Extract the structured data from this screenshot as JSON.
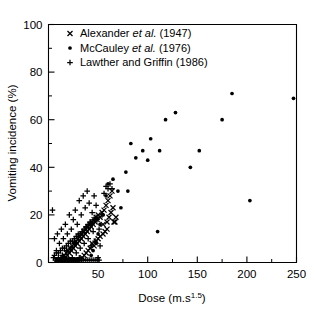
{
  "chart_data": {
    "type": "scatter",
    "title": "",
    "xlabel": "Dose (m.s1.5)",
    "xlabel_base": "Dose (m.s",
    "xlabel_sup": "1.5",
    "xlabel_tail": ")",
    "ylabel": "Vomiting incidence (%)",
    "xlim": [
      0,
      250
    ],
    "ylim": [
      0,
      100
    ],
    "xticks": [
      0,
      50,
      100,
      150,
      200,
      250
    ],
    "xticklabels": [
      "",
      "50",
      "100",
      "150",
      "200",
      "250"
    ],
    "xminorticks": [
      25,
      75,
      125,
      175,
      225
    ],
    "yticks": [
      0,
      20,
      40,
      60,
      80,
      100
    ],
    "yticklabels": [
      "0",
      "20",
      "40",
      "60",
      "80",
      "100"
    ],
    "yminorticks": [
      10,
      30,
      50,
      70,
      90
    ],
    "grid": false,
    "legend_position": "top-left",
    "series": [
      {
        "name": "Alexander et al. (1947)",
        "label_pre": "Alexander ",
        "label_italic": "et al.",
        "label_post": " (1947)",
        "marker": "x",
        "color": "#000000",
        "points": [
          [
            11,
            1
          ],
          [
            13,
            1
          ],
          [
            14,
            2
          ],
          [
            15,
            1
          ],
          [
            16,
            3
          ],
          [
            17,
            2
          ],
          [
            18,
            4
          ],
          [
            19,
            3
          ],
          [
            20,
            5
          ],
          [
            21,
            4
          ],
          [
            22,
            6
          ],
          [
            23,
            5
          ],
          [
            24,
            7
          ],
          [
            25,
            6
          ],
          [
            26,
            8
          ],
          [
            27,
            7
          ],
          [
            28,
            9
          ],
          [
            29,
            8
          ],
          [
            30,
            10
          ],
          [
            31,
            9
          ],
          [
            32,
            11
          ],
          [
            33,
            10
          ],
          [
            34,
            12
          ],
          [
            35,
            11
          ],
          [
            36,
            13
          ],
          [
            37,
            12
          ],
          [
            38,
            14
          ],
          [
            39,
            13
          ],
          [
            40,
            15
          ],
          [
            41,
            14
          ],
          [
            42,
            16
          ],
          [
            43,
            15
          ],
          [
            44,
            17
          ],
          [
            45,
            16
          ],
          [
            46,
            18
          ],
          [
            47,
            17
          ],
          [
            48,
            19
          ],
          [
            49,
            18
          ],
          [
            50,
            20
          ],
          [
            52,
            19
          ],
          [
            54,
            21
          ],
          [
            55,
            16
          ],
          [
            56,
            22
          ],
          [
            58,
            24
          ],
          [
            59,
            17
          ],
          [
            60,
            26
          ],
          [
            61,
            19
          ],
          [
            62,
            28
          ],
          [
            63,
            21
          ],
          [
            64,
            30
          ],
          [
            65,
            23
          ],
          [
            66,
            17
          ],
          [
            67,
            17
          ],
          [
            68,
            19
          ],
          [
            55,
            12
          ],
          [
            57,
            13
          ],
          [
            59,
            14
          ],
          [
            48,
            9
          ],
          [
            50,
            10
          ],
          [
            52,
            11
          ],
          [
            44,
            8
          ],
          [
            46,
            7
          ],
          [
            42,
            6
          ],
          [
            40,
            5
          ],
          [
            38,
            4
          ],
          [
            36,
            3
          ],
          [
            34,
            2
          ],
          [
            32,
            1
          ],
          [
            30,
            1
          ],
          [
            28,
            1
          ],
          [
            26,
            1
          ],
          [
            24,
            1
          ],
          [
            22,
            1
          ],
          [
            20,
            1
          ],
          [
            18,
            1
          ],
          [
            16,
            1
          ],
          [
            14,
            1
          ],
          [
            12,
            1
          ],
          [
            10,
            1
          ],
          [
            9,
            1
          ],
          [
            8,
            1
          ]
        ]
      },
      {
        "name": "McCauley et al. (1976)",
        "label_pre": "McCauley ",
        "label_italic": "et al.",
        "label_post": " (1976)",
        "marker": "circle",
        "color": "#000000",
        "points": [
          [
            65,
            35
          ],
          [
            70,
            30
          ],
          [
            73,
            23
          ],
          [
            78,
            38
          ],
          [
            80,
            30
          ],
          [
            83,
            50
          ],
          [
            88,
            44
          ],
          [
            95,
            47
          ],
          [
            100,
            43
          ],
          [
            103,
            52
          ],
          [
            110,
            13
          ],
          [
            112,
            47
          ],
          [
            118,
            60
          ],
          [
            128,
            63
          ],
          [
            143,
            40
          ],
          [
            152,
            47
          ],
          [
            175,
            60
          ],
          [
            185,
            71
          ],
          [
            203,
            26
          ],
          [
            247,
            69
          ],
          [
            60,
            33
          ],
          [
            58,
            28
          ],
          [
            55,
            20
          ],
          [
            52,
            16
          ],
          [
            50,
            12
          ],
          [
            48,
            8
          ],
          [
            45,
            5
          ],
          [
            43,
            3
          ]
        ]
      },
      {
        "name": "Lawther and Griffin (1986)",
        "label_pre": "Lawther and Griffin (1986)",
        "label_italic": "",
        "label_post": "",
        "marker": "plus",
        "color": "#000000",
        "points": [
          [
            4,
            22
          ],
          [
            6,
            10
          ],
          [
            8,
            5
          ],
          [
            9,
            12
          ],
          [
            10,
            2
          ],
          [
            11,
            8
          ],
          [
            12,
            1
          ],
          [
            13,
            14
          ],
          [
            14,
            3
          ],
          [
            15,
            10
          ],
          [
            16,
            2
          ],
          [
            17,
            16
          ],
          [
            18,
            5
          ],
          [
            19,
            12
          ],
          [
            20,
            1
          ],
          [
            21,
            20
          ],
          [
            22,
            6
          ],
          [
            23,
            14
          ],
          [
            24,
            2
          ],
          [
            25,
            18
          ],
          [
            26,
            8
          ],
          [
            27,
            22
          ],
          [
            28,
            4
          ],
          [
            29,
            16
          ],
          [
            30,
            11
          ],
          [
            31,
            26
          ],
          [
            32,
            6
          ],
          [
            33,
            20
          ],
          [
            34,
            13
          ],
          [
            35,
            28
          ],
          [
            36,
            8
          ],
          [
            37,
            23
          ],
          [
            38,
            15
          ],
          [
            39,
            30
          ],
          [
            40,
            10
          ],
          [
            41,
            25
          ],
          [
            42,
            17
          ],
          [
            43,
            7
          ],
          [
            44,
            21
          ],
          [
            45,
            13
          ],
          [
            46,
            28
          ],
          [
            47,
            9
          ],
          [
            48,
            24
          ],
          [
            49,
            18
          ],
          [
            50,
            2
          ],
          [
            51,
            14
          ],
          [
            52,
            7
          ],
          [
            54,
            20
          ],
          [
            56,
            29
          ],
          [
            58,
            32
          ],
          [
            60,
            31
          ],
          [
            62,
            33
          ],
          [
            64,
            31
          ],
          [
            5,
            2
          ],
          [
            7,
            1
          ],
          [
            9,
            1
          ],
          [
            11,
            1
          ],
          [
            13,
            1
          ],
          [
            15,
            1
          ],
          [
            17,
            1
          ],
          [
            19,
            1
          ],
          [
            21,
            1
          ],
          [
            23,
            1
          ],
          [
            25,
            1
          ],
          [
            27,
            1
          ],
          [
            29,
            1
          ],
          [
            31,
            2
          ],
          [
            33,
            1
          ],
          [
            35,
            1
          ],
          [
            37,
            1
          ],
          [
            39,
            1
          ],
          [
            41,
            1
          ],
          [
            43,
            1
          ],
          [
            45,
            1
          ],
          [
            47,
            1
          ],
          [
            49,
            1
          ],
          [
            51,
            1
          ],
          [
            6,
            3
          ],
          [
            8,
            4
          ],
          [
            10,
            4
          ],
          [
            12,
            5
          ],
          [
            14,
            6
          ],
          [
            16,
            6
          ],
          [
            18,
            7
          ],
          [
            20,
            8
          ],
          [
            22,
            9
          ],
          [
            24,
            9
          ],
          [
            26,
            10
          ],
          [
            28,
            11
          ],
          [
            30,
            12
          ],
          [
            32,
            12
          ],
          [
            34,
            13
          ],
          [
            36,
            14
          ],
          [
            38,
            15
          ],
          [
            40,
            16
          ],
          [
            42,
            16
          ],
          [
            44,
            17
          ],
          [
            46,
            18
          ],
          [
            48,
            19
          ]
        ]
      }
    ]
  }
}
